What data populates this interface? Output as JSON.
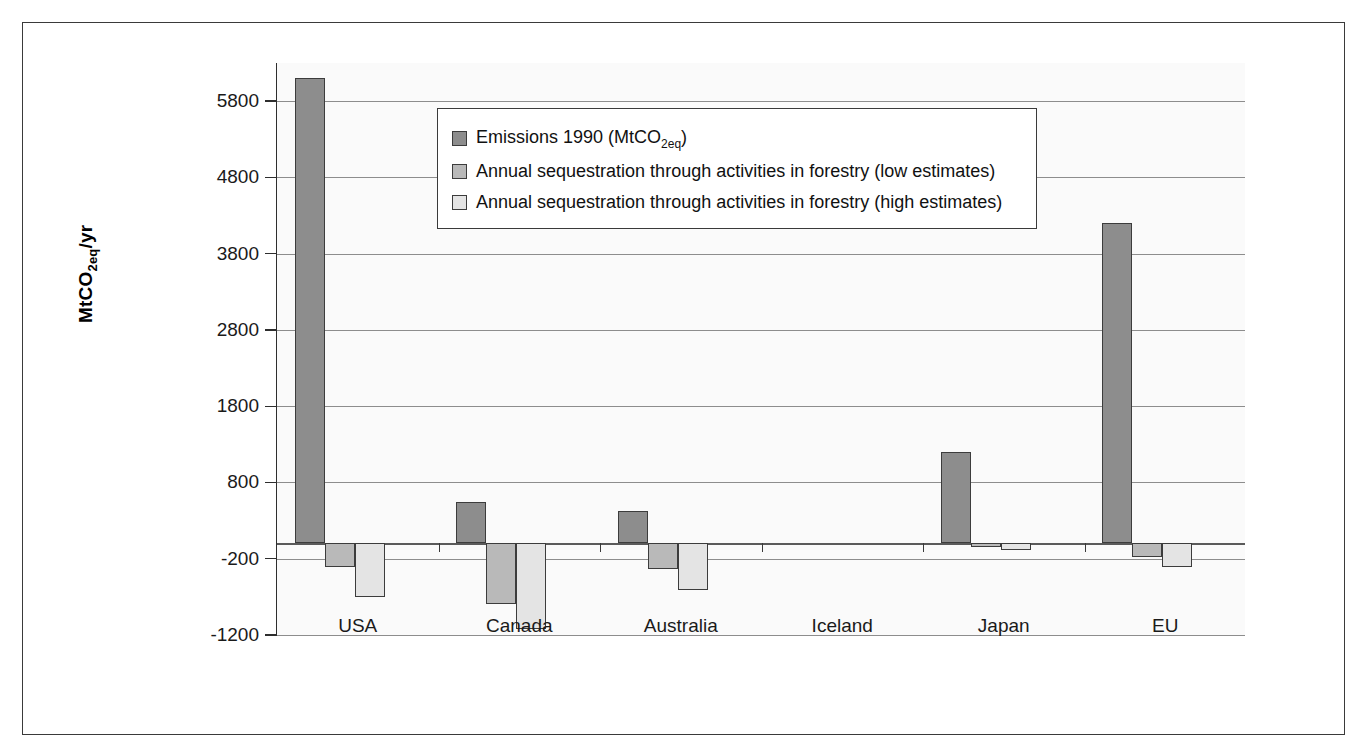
{
  "chart_data": {
    "type": "bar",
    "title": "",
    "xlabel": "",
    "ylabel": "MtCO2eq/yr",
    "ylabel_parts": {
      "pre": "MtCO",
      "sub": "2eq",
      "post": "/yr"
    },
    "ylim": [
      -1200,
      6300
    ],
    "yticks": [
      5800,
      4800,
      3800,
      2800,
      1800,
      800,
      -200,
      -1200
    ],
    "ytick_labels": [
      "5800",
      "4800",
      "3800",
      "2800",
      "1800",
      "800",
      "-200",
      "-1200"
    ],
    "grid": true,
    "legend_position": "upper-center",
    "categories": [
      "USA",
      "Canada",
      "Australia",
      "Iceland",
      "Japan",
      "EU"
    ],
    "series": [
      {
        "name": "Emissions 1990 (MtCO2eq)",
        "label_parts": {
          "pre": "Emissions 1990 (MtCO",
          "sub": "2eq",
          "post": ")"
        },
        "color": "#8d8d8d",
        "values": [
          6100,
          540,
          420,
          0,
          1200,
          4200
        ]
      },
      {
        "name": "Annual sequestration through activities in forestry (low estimates)",
        "label_parts": {
          "pre": "Annual sequestration through activities in forestry (low estimates)",
          "sub": "",
          "post": ""
        },
        "color": "#b9b9b9",
        "values": [
          -310,
          -800,
          -330,
          0,
          -50,
          -180
        ]
      },
      {
        "name": "Annual sequestration through activities in forestry (high estimates)",
        "label_parts": {
          "pre": "Annual sequestration through activities in forestry (high estimates)",
          "sub": "",
          "post": ""
        },
        "color": "#e4e4e4",
        "values": [
          -700,
          -1120,
          -610,
          0,
          -80,
          -310
        ]
      }
    ]
  }
}
